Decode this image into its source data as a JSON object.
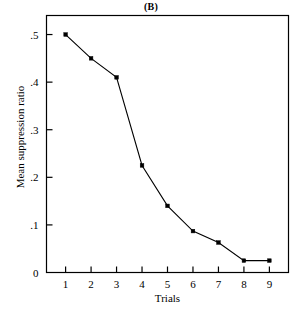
{
  "chart_data": {
    "type": "line",
    "title": "(B)",
    "xlabel": "Trials",
    "ylabel": "Mean suppression ratio",
    "categories": [
      1,
      2,
      3,
      4,
      5,
      6,
      7,
      8,
      9
    ],
    "x": [
      1,
      2,
      3,
      4,
      5,
      6,
      7,
      8,
      9
    ],
    "values": [
      0.5,
      0.45,
      0.41,
      0.225,
      0.14,
      0.087,
      0.063,
      0.025,
      0.025
    ],
    "xlim": [
      0.25,
      9.75
    ],
    "ylim": [
      0,
      0.54
    ],
    "x_tick_labels": [
      "1",
      "2",
      "3",
      "4",
      "5",
      "6",
      "7",
      "8",
      "9"
    ],
    "y_tick_values": [
      0,
      0.1,
      0.2,
      0.3,
      0.4,
      0.5
    ],
    "y_tick_labels": [
      "0",
      ".1",
      ".2",
      ".3",
      ".4",
      ".5"
    ],
    "grid": false,
    "legend": null,
    "marker": "square",
    "line_color": "#000000",
    "marker_color": "#000000",
    "background_color": "#ffffff",
    "frame_color": "#000000"
  }
}
